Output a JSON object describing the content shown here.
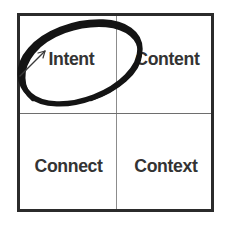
{
  "diagram": {
    "type": "2x2-matrix",
    "colors": {
      "background": "#ffffff",
      "outer_border": "#2b2b2b",
      "inner_divider": "#8c8c8c",
      "label_text": "#333333",
      "annotation_ink": "#141414"
    },
    "cells": [
      {
        "position": "top-left",
        "label": "Intent"
      },
      {
        "position": "top-right",
        "label": "Content"
      },
      {
        "position": "bottom-left",
        "label": "Connect"
      },
      {
        "position": "bottom-right",
        "label": "Context"
      }
    ],
    "annotation": {
      "shape": "hand-drawn-ellipse",
      "target_cell": "top-left",
      "target_label": "Intent",
      "description": "Thick black hand-drawn ellipse circling the Intent quadrant, overlapping the left border and the Content label",
      "stroke_width": 5,
      "rotation_degrees": -20
    }
  }
}
